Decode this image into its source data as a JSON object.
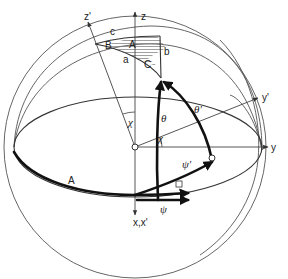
{
  "diagram": {
    "type": "spherical-coordinate-rotation",
    "axes": {
      "z": "z",
      "z_prime": "z'",
      "y": "y",
      "y_prime": "y'",
      "x": "x,x'"
    },
    "angles": {
      "chi_upper": "χ",
      "chi_lower": "χ",
      "theta": "θ",
      "theta_prime": "θ'",
      "psi": "ψ",
      "psi_prime": "ψ'"
    },
    "spherical_triangle": {
      "vertices": [
        "A",
        "B",
        "C"
      ],
      "sides": [
        "a",
        "b",
        "c"
      ]
    },
    "arc_label": "A",
    "colors": {
      "line": "#333333",
      "thick_line": "#111111",
      "hatch": "#777777",
      "background": "#ffffff"
    }
  }
}
